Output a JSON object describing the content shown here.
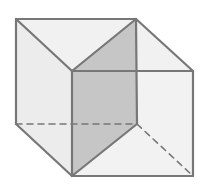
{
  "diagram": {
    "type": "cube-with-diagonal-plane",
    "colors": {
      "background": "#ffffff",
      "face_light": "#f1f1f1",
      "face_shaded": "#c6c6c6",
      "edge": "#777777"
    },
    "vertices": {
      "back_top_left": [
        16,
        19
      ],
      "back_top_right": [
        136,
        19
      ],
      "front_top_left": [
        72,
        71
      ],
      "front_top_right": [
        193,
        71
      ],
      "back_bottom_left": [
        16,
        124
      ],
      "back_bottom_right": [
        137,
        124
      ],
      "front_bottom_left": [
        72,
        176
      ],
      "front_bottom_right": [
        193,
        176
      ]
    },
    "shaded_plane": [
      "back_top_right",
      "front_top_left",
      "front_bottom_left",
      "back_bottom_right"
    ],
    "hidden_edges": [
      [
        "back_bottom_left",
        "back_bottom_right"
      ],
      [
        "back_bottom_right",
        "front_bottom_right"
      ]
    ]
  }
}
